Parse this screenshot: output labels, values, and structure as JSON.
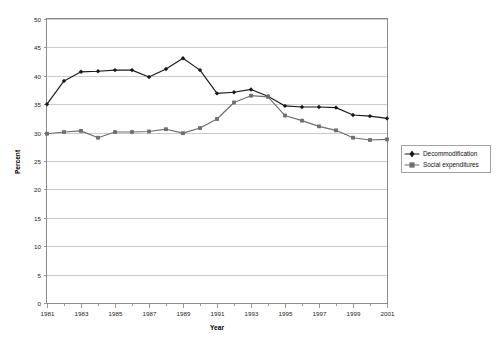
{
  "chart_data": {
    "type": "line",
    "title": "",
    "xlabel": "Year",
    "ylabel": "Percent",
    "xlim": [
      1981,
      2001
    ],
    "ylim": [
      0,
      50
    ],
    "ytick_step": 5,
    "xtick_label_step": 2,
    "grid": "horizontal",
    "legend_position": "right",
    "x": [
      1981,
      1982,
      1983,
      1984,
      1985,
      1986,
      1987,
      1988,
      1989,
      1990,
      1991,
      1992,
      1993,
      1994,
      1995,
      1996,
      1997,
      1998,
      1999,
      2000,
      2001
    ],
    "xtick_labels": [
      "1981",
      "1983",
      "1985",
      "1987",
      "1989",
      "1991",
      "1993",
      "1995",
      "1997",
      "1999",
      "2001"
    ],
    "ytick_labels": [
      "0",
      "5",
      "10",
      "15",
      "20",
      "25",
      "30",
      "35",
      "40",
      "45",
      "50"
    ],
    "series": [
      {
        "name": "Decommodification",
        "color": "#1a1a1a",
        "marker": "diamond",
        "values": [
          35.0,
          39.1,
          40.7,
          40.8,
          41.0,
          41.0,
          39.8,
          41.2,
          43.1,
          41.0,
          36.9,
          37.1,
          37.6,
          36.4,
          34.7,
          34.5,
          34.5,
          34.4,
          33.1,
          32.9,
          32.5
        ]
      },
      {
        "name": "Social expenditures",
        "color": "#6e6e6e",
        "marker": "square",
        "values": [
          29.8,
          30.1,
          30.3,
          29.1,
          30.1,
          30.1,
          30.2,
          30.6,
          29.9,
          30.8,
          32.4,
          35.3,
          36.5,
          36.3,
          33.0,
          32.1,
          31.1,
          30.4,
          29.1,
          28.7,
          28.8
        ]
      }
    ]
  },
  "legend": {
    "items": [
      {
        "label": "Decommodification"
      },
      {
        "label": "Social expenditures"
      }
    ]
  },
  "axes": {
    "x_title": "Year",
    "y_title": "Percent"
  }
}
